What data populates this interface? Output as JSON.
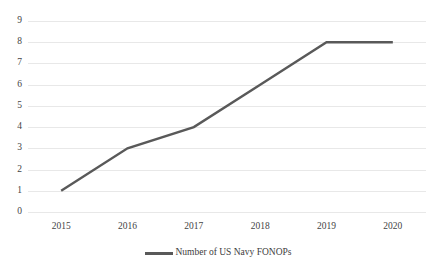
{
  "chart_data": {
    "type": "line",
    "title": "",
    "xlabel": "",
    "ylabel": "",
    "categories": [
      "2015",
      "2016",
      "2017",
      "2018",
      "2019",
      "2020"
    ],
    "series": [
      {
        "name": "Number of US Navy FONOPs",
        "values": [
          1,
          3,
          4,
          6,
          8,
          8
        ],
        "color": "#595959"
      }
    ],
    "ylim": [
      0,
      9
    ],
    "yticks": [
      0,
      1,
      2,
      3,
      4,
      5,
      6,
      7,
      8,
      9
    ],
    "ytick_labels": [
      "0",
      "1",
      "2",
      "3",
      "4",
      "5",
      "6",
      "7",
      "8",
      "9"
    ],
    "grid": "horizontal",
    "grid_color": "#e8e8e8",
    "legend_position": "bottom",
    "annotations": []
  },
  "legend": {
    "entries": [
      {
        "label": "Number of US Navy FONOPs",
        "swatch_name": "legend-line-swatch"
      }
    ]
  }
}
